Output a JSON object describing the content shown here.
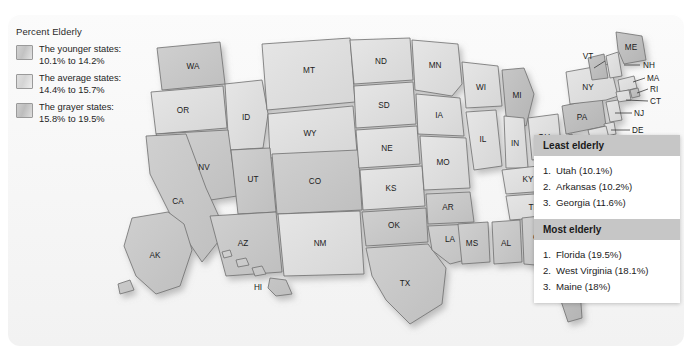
{
  "legend": {
    "title": "Percent Elderly",
    "items": [
      {
        "label": "The younger states:\n10.1% to 14.2%",
        "swatch": "younger-swatch",
        "color": "#c8c8c8"
      },
      {
        "label": "The average states:\n14.4% to 15.7%",
        "swatch": "average-swatch",
        "color": "#dcdcdc"
      },
      {
        "label": "The grayer states:\n15.8% to 19.5%",
        "swatch": "grayer-swatch",
        "color": "#c2c2c2"
      }
    ]
  },
  "panels": [
    {
      "heading": "Least elderly",
      "items": [
        {
          "rank": "1.",
          "text": "Utah (10.1%)"
        },
        {
          "rank": "2.",
          "text": "Arkansas (10.2%)"
        },
        {
          "rank": "3.",
          "text": "Georgia (11.6%)"
        }
      ]
    },
    {
      "heading": "Most elderly",
      "items": [
        {
          "rank": "1.",
          "text": "Florida (19.5%)"
        },
        {
          "rank": "2.",
          "text": "West Virginia (18.1%)"
        },
        {
          "rank": "3.",
          "text": "Maine (18%)"
        }
      ]
    }
  ],
  "map": {
    "title": "United States percent elderly choropleth",
    "state_labels": [
      "WA",
      "OR",
      "ID",
      "MT",
      "WY",
      "NV",
      "UT",
      "CO",
      "CA",
      "AZ",
      "NM",
      "ND",
      "SD",
      "NE",
      "KS",
      "OK",
      "TX",
      "MN",
      "IA",
      "MO",
      "AR",
      "LA",
      "WI",
      "IL",
      "MI",
      "IN",
      "OH",
      "KY",
      "TN",
      "MS",
      "AL",
      "GA",
      "FL",
      "SC",
      "NC",
      "VA",
      "WV",
      "PA",
      "NY",
      "VT",
      "NH",
      "ME",
      "MA",
      "RI",
      "CT",
      "NJ",
      "DE",
      "MD",
      "DC",
      "AK",
      "HI"
    ]
  },
  "colors": {
    "younger": "#c8c8c8",
    "average": "#dcdcdc",
    "grayer": "#c2c2c2",
    "panel_header": "#c6c6c6",
    "outline": "#6f6f6f",
    "background": "#f6f6f6"
  }
}
